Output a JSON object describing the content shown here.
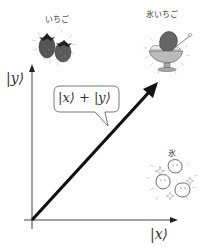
{
  "diagram": {
    "y_axis_label": "|y⟩",
    "x_axis_label": "|x⟩",
    "bubble_text": "|x⟩ + |y⟩",
    "items": [
      {
        "id": "strawberry",
        "label": "いちご",
        "description": "two strawberries at top of y-axis"
      },
      {
        "id": "strawberry-kakigori",
        "label": "氷いちご",
        "description": "shaved ice with strawberry syrup at tip of diagonal vector"
      },
      {
        "id": "ice",
        "label": "氷",
        "description": "ice cubes near end of x-axis"
      }
    ],
    "colors": {
      "axis": "#444444",
      "vector": "#111111",
      "fill_dark": "#555555",
      "fill_light": "#bbbbbb"
    }
  }
}
